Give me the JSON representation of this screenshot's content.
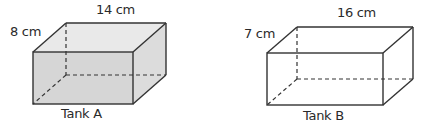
{
  "tanks": [
    {
      "name": "Tank A",
      "width_label": "14 cm",
      "depth_label": "8 cm",
      "filled": true,
      "fill_color": "#dcdcdc"
    },
    {
      "name": "Tank B",
      "width_label": "16 cm",
      "depth_label": "7 cm",
      "filled": false,
      "fill_color": "#ffffff"
    }
  ],
  "colors": {
    "stroke": "#333333",
    "front_fill_a": "#d9d9d9",
    "top_fill_a": "#e8e8e8",
    "side_fill_a": "#dedede"
  }
}
